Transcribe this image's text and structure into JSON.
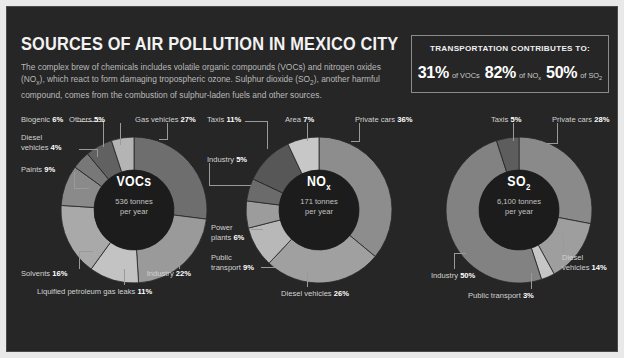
{
  "header": {
    "title": "SOURCES OF AIR POLLUTION IN MEXICO CITY",
    "subtitle": "The complex brew of chemicals includes volatile organic compounds (VOCs) and nitrogen oxides (NOx), which react to form damaging tropospheric ozone. Sulphur dioxide (SO2), another harmful compound, comes from the combustion of sulphur-laden fuels and other sources."
  },
  "transport": {
    "title": "TRANSPORTATION CONTRIBUTES TO:",
    "stats": [
      {
        "value": "31%",
        "label": "of VOCs"
      },
      {
        "value": "82%",
        "label": "of NO"
      },
      {
        "value": "50%",
        "label": "of SO"
      }
    ],
    "stat_subs": [
      "",
      "x",
      "2"
    ]
  },
  "chart_data": [
    {
      "type": "pie",
      "title": "VOCs",
      "center_amount": "536 tonnes",
      "center_unit": "per year",
      "categories": [
        "Gas vehicles",
        "Industry",
        "Liquified petroleum gas leaks",
        "Solvents",
        "Paints",
        "Diesel vehicles",
        "Biogenic",
        "Others"
      ],
      "values": [
        27,
        22,
        11,
        16,
        9,
        4,
        6,
        5
      ],
      "labels": [
        "Gas vehicles 27%",
        "Industry 22%",
        "Liquified petroleum gas leaks 11%",
        "Solvents 16%",
        "Paints 9%",
        "Diesel vehicles 4%",
        "Biogenic 6%",
        "Others 5%"
      ],
      "colors": [
        "#6e6e6e",
        "#9a9a9a",
        "#c3c3c3",
        "#a9a9a9",
        "#8a8a8a",
        "#787878",
        "#616161",
        "#b4b4b4"
      ]
    },
    {
      "type": "pie",
      "title": "NOx",
      "center_amount": "171 tonnes",
      "center_unit": "per year",
      "categories": [
        "Private cars",
        "Diesel vehicles",
        "Public transport",
        "Power plants",
        "Industry",
        "Taxis",
        "Area"
      ],
      "values": [
        36,
        26,
        9,
        6,
        5,
        11,
        7
      ],
      "labels": [
        "Private cars 36%",
        "Diesel vehicles 26%",
        "Public transport 9%",
        "Power plants 6%",
        "Industry 5%",
        "Taxis 11%",
        "Area 7%"
      ],
      "colors": [
        "#8d8d8d",
        "#a0a0a0",
        "#b8b8b8",
        "#9c9c9c",
        "#6b6b6b",
        "#575757",
        "#c7c7c7"
      ]
    },
    {
      "type": "pie",
      "title": "SO2",
      "center_amount": "6,100 tonnes",
      "center_unit": "per year",
      "categories": [
        "Private cars",
        "Diesel vehicles",
        "Public transport",
        "Industry",
        "Taxis"
      ],
      "values": [
        28,
        14,
        3,
        50,
        5
      ],
      "labels": [
        "Private cars 28%",
        "Diesel vehicles 14%",
        "Public transport 3%",
        "Industry 50%",
        "Taxis 5%"
      ],
      "colors": [
        "#8a8a8a",
        "#9e9e9e",
        "#c6c6c6",
        "#828282",
        "#5d5d5d"
      ]
    }
  ],
  "colors": {
    "background": "#262626",
    "border": "#4a4a4a",
    "text": "#d2d2d2",
    "highlight": "#ffffff",
    "leader": "#9a9a9a"
  }
}
